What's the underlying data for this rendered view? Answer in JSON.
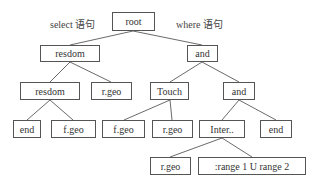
{
  "labels": {
    "select": "select 语句",
    "where": "where 语句"
  },
  "nodes": {
    "root": "root",
    "resdom1": "resdom",
    "and1": "and",
    "resdom2": "resdom",
    "rgeo1": "r.geo",
    "touch": "Touch",
    "and2": "and",
    "end1": "end",
    "fgeo1": "f.geo",
    "fgeo2": "f.geo",
    "rgeo2": "r.geo",
    "inter": "Inter..",
    "end2": "end",
    "rgeo3": "r.geo",
    "range": ":range 1 U range 2"
  },
  "edges": [
    [
      "root",
      "resdom1"
    ],
    [
      "root",
      "and1"
    ],
    [
      "resdom1",
      "resdom2"
    ],
    [
      "resdom1",
      "rgeo1"
    ],
    [
      "and1",
      "touch"
    ],
    [
      "and1",
      "and2"
    ],
    [
      "resdom2",
      "end1"
    ],
    [
      "resdom2",
      "fgeo1"
    ],
    [
      "touch",
      "fgeo2"
    ],
    [
      "touch",
      "rgeo2"
    ],
    [
      "and2",
      "inter"
    ],
    [
      "and2",
      "end2"
    ],
    [
      "inter",
      "rgeo3"
    ],
    [
      "inter",
      "range"
    ]
  ]
}
